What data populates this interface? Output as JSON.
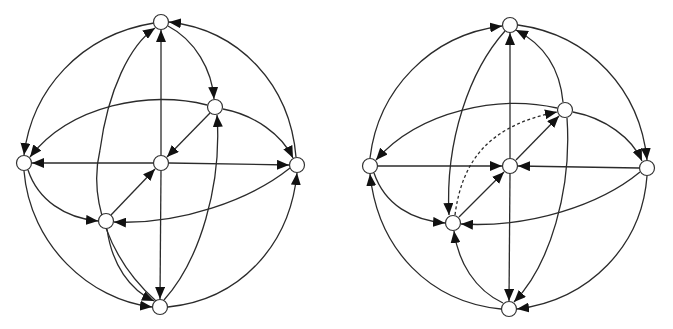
{
  "figure": {
    "panels": [
      {
        "id": "left",
        "nodes": [
          {
            "id": "T",
            "x": 161,
            "y": 22
          },
          {
            "id": "UR",
            "x": 215,
            "y": 107
          },
          {
            "id": "L",
            "x": 24,
            "y": 163
          },
          {
            "id": "C",
            "x": 161,
            "y": 163
          },
          {
            "id": "R",
            "x": 297,
            "y": 165
          },
          {
            "id": "LL",
            "x": 106,
            "y": 221
          },
          {
            "id": "B",
            "x": 160,
            "y": 307
          }
        ],
        "edges": [
          {
            "from": "T",
            "to": "L",
            "style": "solid"
          },
          {
            "from": "L",
            "to": "B",
            "style": "solid"
          },
          {
            "from": "B",
            "to": "R",
            "style": "solid"
          },
          {
            "from": "R",
            "to": "T",
            "style": "solid"
          },
          {
            "from": "T",
            "to": "UR",
            "style": "solid"
          },
          {
            "from": "UR",
            "to": "L",
            "style": "solid"
          },
          {
            "from": "UR",
            "to": "R",
            "style": "solid"
          },
          {
            "from": "R",
            "to": "LL",
            "style": "solid"
          },
          {
            "from": "L",
            "to": "LL",
            "style": "solid"
          },
          {
            "from": "LL",
            "to": "B",
            "style": "solid"
          },
          {
            "from": "B",
            "to": "UR",
            "style": "solid"
          },
          {
            "from": "B",
            "to": "T",
            "style": "solid"
          },
          {
            "from": "C",
            "to": "T",
            "style": "solid"
          },
          {
            "from": "C",
            "to": "B",
            "style": "solid"
          },
          {
            "from": "C",
            "to": "L",
            "style": "solid"
          },
          {
            "from": "C",
            "to": "R",
            "style": "solid"
          },
          {
            "from": "UR",
            "to": "C",
            "style": "solid"
          },
          {
            "from": "LL",
            "to": "C",
            "style": "solid"
          }
        ]
      },
      {
        "id": "right",
        "nodes": [
          {
            "id": "T",
            "x": 510,
            "y": 25
          },
          {
            "id": "UR",
            "x": 565,
            "y": 110
          },
          {
            "id": "L",
            "x": 370,
            "y": 166
          },
          {
            "id": "C",
            "x": 510,
            "y": 166
          },
          {
            "id": "R",
            "x": 647,
            "y": 168
          },
          {
            "id": "LL",
            "x": 453,
            "y": 223
          },
          {
            "id": "B",
            "x": 509,
            "y": 309
          }
        ],
        "edges": [
          {
            "from": "L",
            "to": "T",
            "style": "solid"
          },
          {
            "from": "T",
            "to": "R",
            "style": "solid"
          },
          {
            "from": "R",
            "to": "B",
            "style": "solid"
          },
          {
            "from": "B",
            "to": "L",
            "style": "solid"
          },
          {
            "from": "UR",
            "to": "T",
            "style": "solid"
          },
          {
            "from": "T",
            "to": "LL",
            "style": "solid"
          },
          {
            "from": "UR",
            "to": "L",
            "style": "solid"
          },
          {
            "from": "UR",
            "to": "R",
            "style": "solid"
          },
          {
            "from": "R",
            "to": "LL",
            "style": "solid"
          },
          {
            "from": "L",
            "to": "LL",
            "style": "solid"
          },
          {
            "from": "B",
            "to": "LL",
            "style": "solid"
          },
          {
            "from": "UR",
            "to": "B",
            "style": "solid"
          },
          {
            "from": "C",
            "to": "T",
            "style": "solid"
          },
          {
            "from": "C",
            "to": "B",
            "style": "solid"
          },
          {
            "from": "L",
            "to": "C",
            "style": "solid"
          },
          {
            "from": "R",
            "to": "C",
            "style": "solid"
          },
          {
            "from": "LL",
            "to": "C",
            "style": "solid"
          },
          {
            "from": "C",
            "to": "UR",
            "style": "solid"
          },
          {
            "from": "LL",
            "to": "UR",
            "style": "dashed"
          }
        ]
      }
    ],
    "colors": {
      "stroke": "#2b2b2b",
      "node_fill": "#ffffff",
      "background": "#ffffff"
    }
  }
}
